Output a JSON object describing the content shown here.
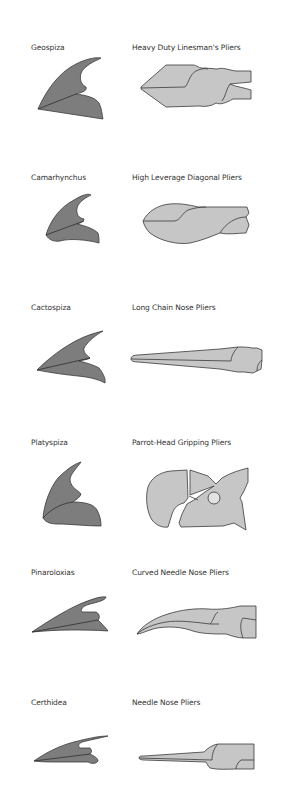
{
  "figure": {
    "colors": {
      "beak_fill": "#7d7d7d",
      "plier_fill": "#c6c6c6",
      "outline": "#3a3a3a",
      "background": "#ffffff"
    },
    "pairs": [
      {
        "bird": "Geospiza",
        "tool": "Heavy Duty Linesman's Pliers",
        "bird_icon": "geospiza-beak-icon",
        "tool_icon": "linesman-pliers-icon"
      },
      {
        "bird": "Camarhynchus",
        "tool": "High Leverage Diagonal Pliers",
        "bird_icon": "camarhynchus-beak-icon",
        "tool_icon": "diagonal-pliers-icon"
      },
      {
        "bird": "Cactospiza",
        "tool": "Long Chain Nose Pliers",
        "bird_icon": "cactospiza-beak-icon",
        "tool_icon": "chain-nose-pliers-icon"
      },
      {
        "bird": "Platyspiza",
        "tool": "Parrot-Head Gripping Pliers",
        "bird_icon": "platyspiza-beak-icon",
        "tool_icon": "parrot-head-pliers-icon"
      },
      {
        "bird": "Pinaroloxias",
        "tool": "Curved Needle Nose Pliers",
        "bird_icon": "pinaroloxias-beak-icon",
        "tool_icon": "curved-needle-nose-pliers-icon"
      },
      {
        "bird": "Certhidea",
        "tool": "Needle Nose Pliers",
        "bird_icon": "certhidea-beak-icon",
        "tool_icon": "needle-nose-pliers-icon"
      }
    ]
  }
}
